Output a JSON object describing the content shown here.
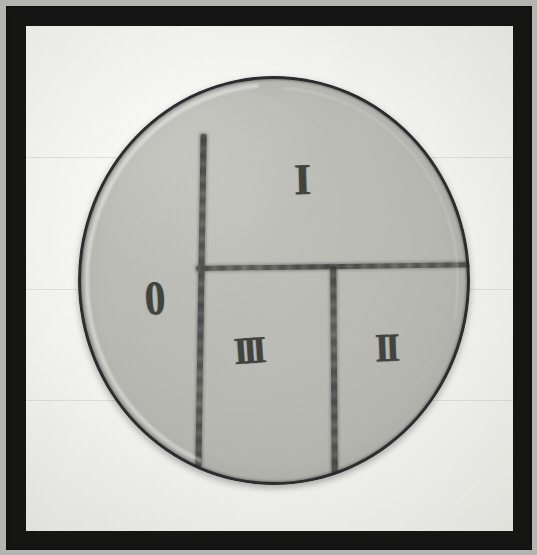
{
  "image": {
    "subject": "petri-dish-quadrant-streak-plate",
    "frame_color": "#151514",
    "backdrop_color": "#f4f4f0",
    "outer_margin_color": "#b4b5b0"
  },
  "dish": {
    "agar_color": "#bcbdb6",
    "rim_color": "#26262a",
    "marker_color": "#4a4a48",
    "streaks": [
      {
        "name": "vertical-main",
        "orientation": "vertical",
        "description": "long vertical divider left of centre"
      },
      {
        "name": "horizontal",
        "orientation": "horizontal",
        "description": "horizontal divider crossing to right rim"
      },
      {
        "name": "vertical-second",
        "orientation": "vertical",
        "description": "short vertical divider below horizontal"
      }
    ],
    "labels": [
      {
        "id": "sector-0",
        "text": "0",
        "quadrant": "left",
        "numeral": "zero"
      },
      {
        "id": "sector-1",
        "text": "I",
        "quadrant": "top-right",
        "numeral": "one"
      },
      {
        "id": "sector-2",
        "text": "II",
        "quadrant": "bottom-right",
        "numeral": "two"
      },
      {
        "id": "sector-3",
        "text": "III",
        "quadrant": "bottom-centre",
        "numeral": "three"
      }
    ]
  },
  "paper_streaks": [
    {
      "top_pct": 26
    },
    {
      "top_pct": 52
    },
    {
      "top_pct": 74
    }
  ]
}
